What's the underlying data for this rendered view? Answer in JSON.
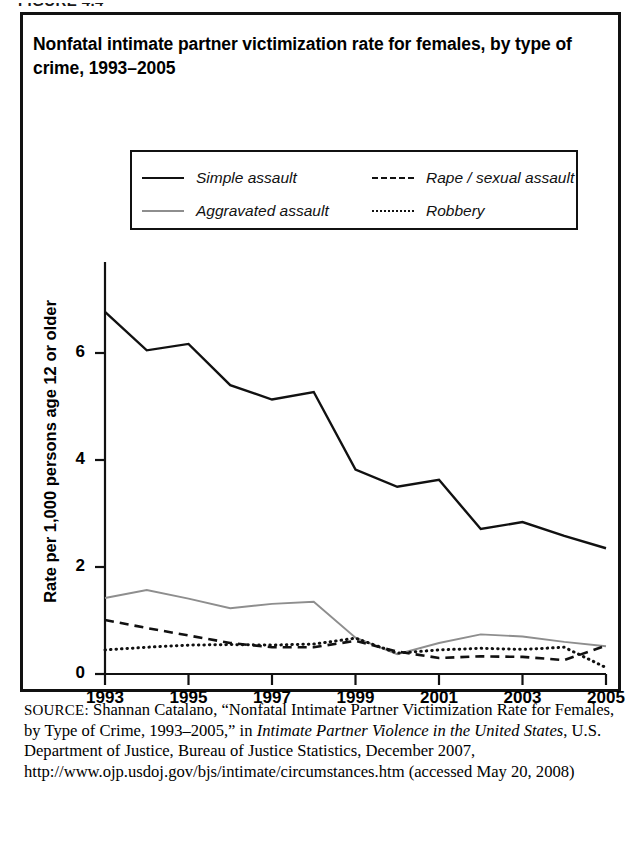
{
  "figure": {
    "label": "FIGURE 4.4"
  },
  "title": "Nonfatal intimate partner victimization rate for females, by type of crime, 1993–2005",
  "legend": {
    "position": "top-center-inside-plot",
    "items": [
      {
        "label": "Simple assault",
        "style": "solid",
        "color": "#111111",
        "icon": "line-solid-dark-icon"
      },
      {
        "label": "Rape / sexual assault",
        "style": "dashed",
        "color": "#111111",
        "icon": "line-dashed-icon"
      },
      {
        "label": "Aggravated assault",
        "style": "solid",
        "color": "#8e8e8e",
        "icon": "line-solid-gray-icon"
      },
      {
        "label": "Robbery",
        "style": "dotted",
        "color": "#111111",
        "icon": "line-dotted-icon"
      }
    ]
  },
  "axes": {
    "y_title": "Rate per 1,000 persons age 12 or older",
    "y_ticks": [
      "0",
      "2",
      "4",
      "6"
    ],
    "y_tick_values": [
      0,
      2,
      4,
      6
    ],
    "ylim": [
      0,
      7.2
    ],
    "x_ticks": [
      "1993",
      "1995",
      "1997",
      "1999",
      "2001",
      "2003",
      "2005"
    ],
    "xlim": [
      1993,
      2005
    ],
    "grid": "none"
  },
  "source": {
    "prefix": "SOURCE:",
    "text_1": " Shannan Catalano, “Nonfatal Intimate Partner Victimization Rate for Females, by Type of Crime, 1993–2005,” in ",
    "italic_1": "Intimate Partner Violence in the United States",
    "text_2": ", U.S. Department of Justice, Bureau of Justice Statistics, December 2007, http://www.ojp.usdoj.gov/bjs/intimate/circumstances.htm (accessed May 20, 2008)"
  },
  "chart_data": {
    "type": "line",
    "title": "Nonfatal intimate partner victimization rate for females, by type of crime, 1993–2005",
    "xlabel": "",
    "ylabel": "Rate per 1,000 persons age 12 or older",
    "x": [
      1993,
      1994,
      1995,
      1996,
      1997,
      1998,
      1999,
      2000,
      2001,
      2002,
      2003,
      2004,
      2005
    ],
    "xlim": [
      1993,
      2005
    ],
    "ylim": [
      0,
      7.2
    ],
    "yticks": [
      0,
      2,
      4,
      6
    ],
    "xticks": [
      1993,
      1995,
      1997,
      1999,
      2001,
      2003,
      2005
    ],
    "grid": false,
    "legend_position": "upper center",
    "series": [
      {
        "name": "Simple assault",
        "style": "solid",
        "color": "#111111",
        "values": [
          6.77,
          6.05,
          6.17,
          5.4,
          5.13,
          5.27,
          3.82,
          3.5,
          3.63,
          2.71,
          2.84,
          2.58,
          2.35
        ]
      },
      {
        "name": "Aggravated assault",
        "style": "solid",
        "color": "#8e8e8e",
        "values": [
          1.42,
          1.57,
          1.41,
          1.23,
          1.31,
          1.35,
          0.68,
          0.37,
          0.58,
          0.74,
          0.7,
          0.6,
          0.52
        ]
      },
      {
        "name": "Rape / sexual assault",
        "style": "dashed",
        "color": "#111111",
        "values": [
          1.01,
          0.86,
          0.72,
          0.58,
          0.5,
          0.5,
          0.62,
          0.42,
          0.3,
          0.33,
          0.32,
          0.26,
          0.53
        ]
      },
      {
        "name": "Robbery",
        "style": "dotted",
        "color": "#111111",
        "values": [
          0.45,
          0.5,
          0.54,
          0.55,
          0.54,
          0.56,
          0.67,
          0.39,
          0.45,
          0.48,
          0.46,
          0.5,
          0.12
        ]
      }
    ]
  }
}
